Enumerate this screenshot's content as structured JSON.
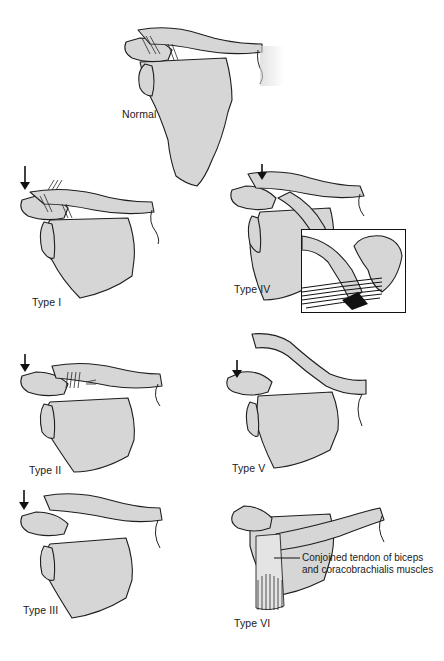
{
  "figure": {
    "bone_fill_color": "#d6d6d6",
    "outline_color": "#1e1e1e",
    "panels": [
      {
        "id": "normal",
        "label": "Normal"
      },
      {
        "id": "type-1",
        "label": "Type I"
      },
      {
        "id": "type-2",
        "label": "Type II"
      },
      {
        "id": "type-3",
        "label": "Type III"
      },
      {
        "id": "type-4",
        "label": "Type IV"
      },
      {
        "id": "type-5",
        "label": "Type V"
      },
      {
        "id": "type-6",
        "label": "Type VI"
      }
    ],
    "annotations": {
      "type_6_callout_line1": "Conjoined tendon of biceps",
      "type_6_callout_line2": "and coracobrachialis muscles"
    }
  }
}
